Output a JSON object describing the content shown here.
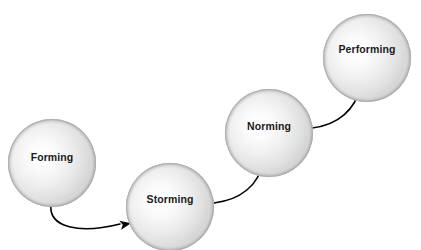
{
  "diagram": {
    "type": "process-flow",
    "background_color": "#ffffff",
    "node_shape": "sphere",
    "node_radius": 44,
    "sphere_highlight_color": "#fdfdfd",
    "sphere_mid_color": "#e4e4e4",
    "sphere_rim_color": "#c0c0c0",
    "sphere_edge_color": "#b0b0b0",
    "label_color": "#1a1a1a",
    "connector_color": "#000000",
    "connector_width": 1.6,
    "stages": [
      {
        "id": "forming",
        "label": "Forming",
        "order": 1,
        "cx": 52,
        "cy": 163,
        "label_x": 52,
        "label_y": 158
      },
      {
        "id": "storming",
        "label": "Storming",
        "order": 2,
        "cx": 170,
        "cy": 207,
        "label_x": 170,
        "label_y": 200
      },
      {
        "id": "norming",
        "label": "Norming",
        "order": 3,
        "cx": 269,
        "cy": 133,
        "label_x": 269,
        "label_y": 127
      },
      {
        "id": "performing",
        "label": "Performing",
        "order": 4,
        "cx": 367,
        "cy": 58,
        "label_x": 367,
        "label_y": 50
      }
    ],
    "connectors": [
      {
        "id": "forming-to-storming",
        "from": "forming",
        "to": "storming",
        "path": "M 51,204 C 48,228 80,234 120,224",
        "arrow_x": 131,
        "arrow_y": 223.2,
        "arrow_rotation": -11
      },
      {
        "id": "storming-to-norming",
        "from": "storming",
        "to": "norming",
        "path": "M 214,203 C 240,200 258,186 264,161",
        "arrow_x": 266.5,
        "arrow_y": 150,
        "arrow_rotation": -75
      },
      {
        "id": "norming-to-performing",
        "from": "norming",
        "to": "performing",
        "path": "M 312,128 C 338,125 355,110 361,86",
        "arrow_x": 363.5,
        "arrow_y": 75,
        "arrow_rotation": -75
      }
    ]
  }
}
